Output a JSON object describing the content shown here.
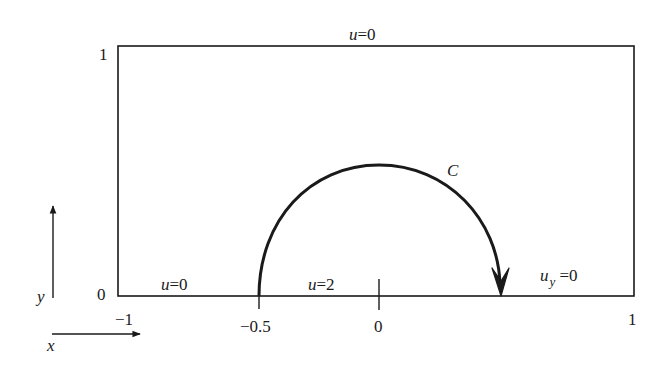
{
  "diagram": {
    "domain": {
      "x_range": [
        -1,
        1
      ],
      "y_range": [
        0,
        1
      ]
    },
    "axis_ticks": {
      "y_top": "1",
      "y_bottom": "0",
      "x_left": "−1",
      "x_mid_left": "−0.5",
      "x_center": "0",
      "x_right": "1"
    },
    "axis_arrows": {
      "x_label": "x",
      "y_label": "y"
    },
    "boundary_conditions": {
      "top": {
        "var": "u",
        "eq": "=0"
      },
      "bottom_left": {
        "var": "u",
        "eq": "=0"
      },
      "bottom_middle": {
        "var": "u",
        "eq": "=2"
      },
      "bottom_right": {
        "var": "u",
        "sub": "y",
        "eq": " =0"
      }
    },
    "contour": {
      "label": "C",
      "shape": "semicircle",
      "from": [
        -0.5,
        0
      ],
      "to": [
        0.5,
        0
      ],
      "direction": "clockwise"
    },
    "colors": {
      "line": "#1a1a1a",
      "background": "#ffffff"
    }
  }
}
